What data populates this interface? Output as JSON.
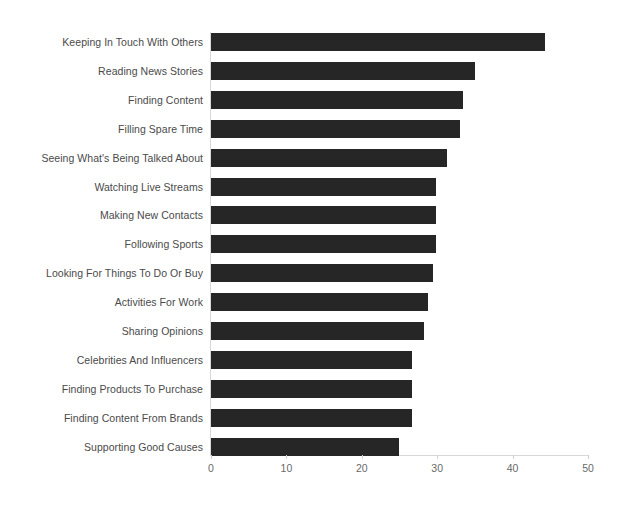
{
  "chart_data": {
    "type": "bar",
    "orientation": "horizontal",
    "title": "",
    "subtitle": "",
    "xlabel": "",
    "ylabel": "",
    "xlim": [
      0,
      50
    ],
    "xticks": [
      0,
      10,
      20,
      30,
      40,
      50
    ],
    "xtick_labels": [
      "0",
      "10",
      "20",
      "30",
      "40",
      "50"
    ],
    "grid": false,
    "legend": null,
    "bar_color": "#262626",
    "axis_color": "#d8d8d8",
    "label_color": "#4a4a4a",
    "tick_label_color": "#6a6a6a",
    "background_color": "#ffffff",
    "categories": [
      "Keeping In Touch With Others",
      "Reading News Stories",
      "Finding Content",
      "Filling Spare Time",
      "Seeing What's Being Talked About",
      "Watching Live Streams",
      "Making New Contacts",
      "Following Sports",
      "Looking For Things To Do Or Buy",
      "Activities For Work",
      "Sharing Opinions",
      "Celebrities And Influencers",
      "Finding Products To Purchase",
      "Finding Content From Brands",
      "Supporting Good Causes"
    ],
    "values": [
      44.3,
      35.0,
      33.4,
      33.0,
      31.3,
      29.8,
      29.8,
      29.8,
      29.4,
      28.8,
      28.2,
      26.6,
      26.7,
      26.6,
      24.9
    ]
  }
}
